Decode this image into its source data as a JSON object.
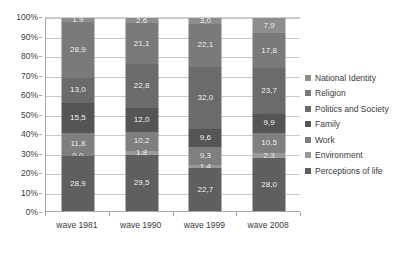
{
  "chart_data": {
    "type": "bar",
    "subtype": "stacked-100-percent-column",
    "title": "",
    "xlabel": "",
    "ylabel": "",
    "ylim": [
      0,
      100
    ],
    "ytick_labels": [
      "0%",
      "10%",
      "20%",
      "30%",
      "40%",
      "50%",
      "60%",
      "70%",
      "80%",
      "90%",
      "100%"
    ],
    "ytick_values": [
      0,
      10,
      20,
      30,
      40,
      50,
      60,
      70,
      80,
      90,
      100
    ],
    "grid": true,
    "legend_position": "right",
    "categories": [
      "wave 1981",
      "wave 1990",
      "wave 1999",
      "wave 2008"
    ],
    "stack_order_top_to_bottom": [
      "National Identity",
      "Religion",
      "Politics and Society",
      "Family",
      "Work",
      "Environment",
      "Perceptions of life"
    ],
    "series": [
      {
        "name": "National Identity",
        "color": "#8d8d8d",
        "values": [
          1.9,
          2.6,
          3.0,
          7.9
        ],
        "labels": [
          "1,9",
          "2,6",
          "3,0",
          "7,9"
        ]
      },
      {
        "name": "Religion",
        "color": "#7a7a7a",
        "values": [
          28.9,
          21.1,
          22.1,
          17.8
        ],
        "labels": [
          "28,9",
          "21,1",
          "22,1",
          "17,8"
        ]
      },
      {
        "name": "Politics and Society",
        "color": "#6b6b6b",
        "values": [
          13.0,
          22.8,
          32.0,
          23.7
        ],
        "labels": [
          "13,0",
          "22,8",
          "32,0",
          "23,7"
        ]
      },
      {
        "name": "Family",
        "color": "#555555",
        "values": [
          15.5,
          12.0,
          9.6,
          9.9
        ],
        "labels": [
          "15,5",
          "12,0",
          "9,6",
          "9,9"
        ]
      },
      {
        "name": "Work",
        "color": "#7f7f7f",
        "values": [
          11.8,
          10.2,
          9.3,
          10.5
        ],
        "labels": [
          "11,8",
          "10,2",
          "9,3",
          "10,5"
        ]
      },
      {
        "name": "Environment",
        "color": "#9a9a9a",
        "values": [
          0.0,
          1.8,
          1.4,
          2.3
        ],
        "labels": [
          "0,0",
          "1,8",
          "1,4",
          "2,3"
        ]
      },
      {
        "name": "Perceptions of life",
        "color": "#5f5f5f",
        "values": [
          28.9,
          29.5,
          22.7,
          28.0
        ],
        "labels": [
          "28,9",
          "29,5",
          "22,7",
          "28,0"
        ]
      }
    ]
  },
  "legend": {
    "items": [
      {
        "label": "National Identity",
        "color": "#8d8d8d"
      },
      {
        "label": "Religion",
        "color": "#7a7a7a"
      },
      {
        "label": "Politics and Society",
        "color": "#6b6b6b"
      },
      {
        "label": "Family",
        "color": "#555555"
      },
      {
        "label": "Work",
        "color": "#7f7f7f"
      },
      {
        "label": "Environment",
        "color": "#9a9a9a"
      },
      {
        "label": "Perceptions of life",
        "color": "#5f5f5f"
      }
    ]
  },
  "axes": {
    "y_labels": [
      "100%",
      "90%",
      "80%",
      "70%",
      "60%",
      "50%",
      "40%",
      "30%",
      "20%",
      "10%",
      "0%"
    ],
    "x_labels": [
      "wave 1981",
      "wave 1990",
      "wave 1999",
      "wave 2008"
    ]
  }
}
